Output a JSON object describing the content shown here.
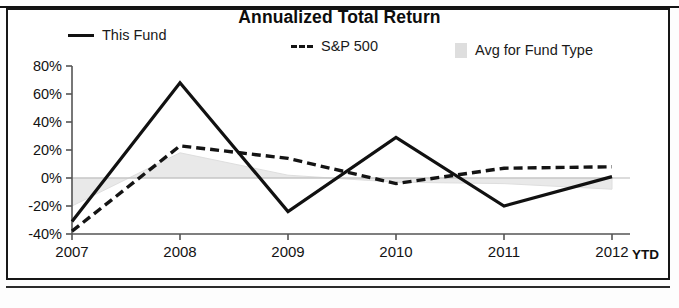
{
  "chart_data": {
    "type": "line",
    "title": "Annualized Total Return",
    "xlabel": "",
    "ylabel": "",
    "x": [
      "2007",
      "2008",
      "2009",
      "2010",
      "2011",
      "2012"
    ],
    "xtick_labels": [
      "2007",
      "2008",
      "2009",
      "2010",
      "2011",
      "2012"
    ],
    "x_suffix_label": "YTD",
    "ytick_labels": [
      "80%",
      "60%",
      "40%",
      "20%",
      "0%",
      "-20%",
      "-40%"
    ],
    "ytick_values": [
      80,
      60,
      40,
      20,
      0,
      -20,
      -40
    ],
    "ylim": [
      -40,
      80
    ],
    "grid": false,
    "legend_position": "top",
    "series": [
      {
        "name": "This Fund",
        "style": "solid",
        "color": "#111111",
        "values": [
          -31,
          68,
          -24,
          29,
          -20,
          1
        ]
      },
      {
        "name": "S&P 500",
        "style": "dashed",
        "color": "#141414",
        "values": [
          -38,
          23,
          14,
          -4,
          7,
          8
        ]
      },
      {
        "name": "Avg for Fund Type",
        "style": "filled-band",
        "color": "#d8d8d8",
        "values": [
          -20,
          18,
          2,
          -3,
          -4,
          -8
        ]
      }
    ]
  },
  "legend": {
    "items": [
      {
        "label": "This Fund",
        "swatch": "solid-line-swatch"
      },
      {
        "label": "S&P 500",
        "swatch": "dashed-line-swatch"
      },
      {
        "label": "Avg for Fund Type",
        "swatch": "filled-square-swatch"
      }
    ]
  },
  "colors": {
    "this_fund": "#111111",
    "sp500": "#141414",
    "avg_fund_type": "#d8d8d8",
    "axis": "#555555",
    "text": "#131313"
  }
}
